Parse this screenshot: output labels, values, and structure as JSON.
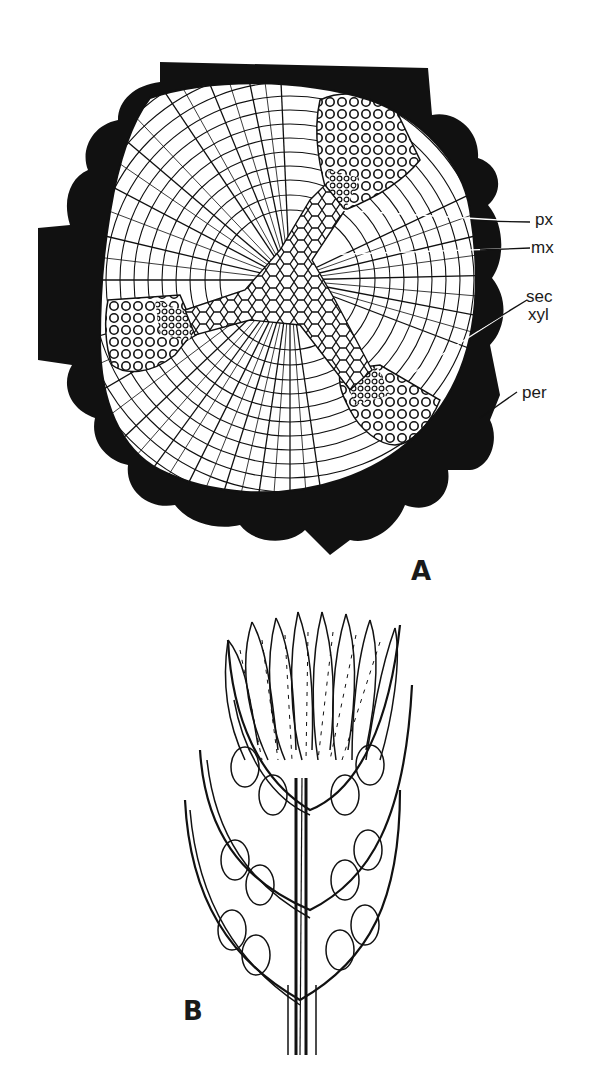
{
  "figure": {
    "panel_a": {
      "label": "A",
      "description": "Transverse section of stem showing triarch primary xylem, secondary xylem and periderm",
      "annotations": [
        {
          "id": "px",
          "text": "px"
        },
        {
          "id": "mx",
          "text": "mx"
        },
        {
          "id": "sec_xyl_1",
          "text": "sec"
        },
        {
          "id": "sec_xyl_2",
          "text": "xyl"
        },
        {
          "id": "per",
          "text": "per"
        }
      ]
    },
    "panel_b": {
      "label": "B",
      "description": "Longitudinal section of cone showing sporophylls with sporangia around central axis"
    },
    "colors": {
      "ink": "#111111",
      "paper": "#ffffff"
    }
  }
}
